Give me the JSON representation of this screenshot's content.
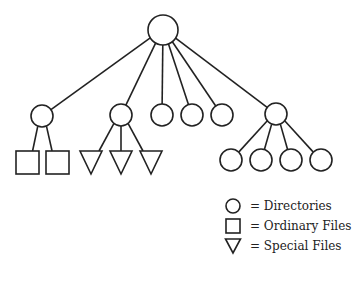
{
  "diagram": {
    "type": "file-system-tree",
    "stroke_color": "#222222",
    "background": "#ffffff",
    "nodes": [
      {
        "id": "root",
        "shape": "circle",
        "cx": 163,
        "cy": 30,
        "r": 15,
        "kind": "directory"
      },
      {
        "id": "d1",
        "shape": "circle",
        "cx": 42,
        "cy": 116,
        "r": 11,
        "kind": "directory",
        "parent": "root"
      },
      {
        "id": "d2",
        "shape": "circle",
        "cx": 121,
        "cy": 115,
        "r": 11,
        "kind": "directory",
        "parent": "root"
      },
      {
        "id": "d3",
        "shape": "circle",
        "cx": 162,
        "cy": 115,
        "r": 11,
        "kind": "directory",
        "parent": "root"
      },
      {
        "id": "d4",
        "shape": "circle",
        "cx": 192,
        "cy": 115,
        "r": 11,
        "kind": "directory",
        "parent": "root"
      },
      {
        "id": "d5",
        "shape": "circle",
        "cx": 222,
        "cy": 115,
        "r": 11,
        "kind": "directory",
        "parent": "root"
      },
      {
        "id": "d6",
        "shape": "circle",
        "cx": 276,
        "cy": 114,
        "r": 11,
        "kind": "directory",
        "parent": "root"
      },
      {
        "id": "f1",
        "shape": "square",
        "x": 16,
        "y": 151,
        "w": 23,
        "h": 23,
        "kind": "ordinary-file",
        "parent": "d1"
      },
      {
        "id": "f2",
        "shape": "square",
        "x": 46,
        "y": 151,
        "w": 23,
        "h": 23,
        "kind": "ordinary-file",
        "parent": "d1"
      },
      {
        "id": "s1",
        "shape": "triangle",
        "x": 80,
        "y": 151,
        "w": 22,
        "h": 23,
        "kind": "special-file",
        "parent": "d2"
      },
      {
        "id": "s2",
        "shape": "triangle",
        "x": 110,
        "y": 151,
        "w": 22,
        "h": 23,
        "kind": "special-file",
        "parent": "d2"
      },
      {
        "id": "s3",
        "shape": "triangle",
        "x": 140,
        "y": 151,
        "w": 22,
        "h": 23,
        "kind": "special-file",
        "parent": "d2"
      },
      {
        "id": "d7",
        "shape": "circle",
        "cx": 231,
        "cy": 160,
        "r": 11,
        "kind": "directory",
        "parent": "d6"
      },
      {
        "id": "d8",
        "shape": "circle",
        "cx": 261,
        "cy": 160,
        "r": 11,
        "kind": "directory",
        "parent": "d6"
      },
      {
        "id": "d9",
        "shape": "circle",
        "cx": 291,
        "cy": 160,
        "r": 11,
        "kind": "directory",
        "parent": "d6"
      },
      {
        "id": "d10",
        "shape": "circle",
        "cx": 321,
        "cy": 160,
        "r": 11,
        "kind": "directory",
        "parent": "d6"
      }
    ]
  },
  "legend": {
    "items": [
      {
        "shape": "circle",
        "label": "= Directories"
      },
      {
        "shape": "square",
        "label": "= Ordinary Files"
      },
      {
        "shape": "triangle",
        "label": "= Special Files"
      }
    ]
  }
}
